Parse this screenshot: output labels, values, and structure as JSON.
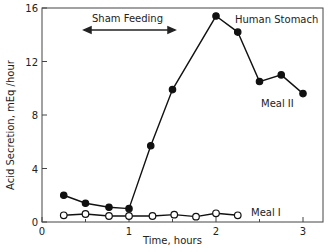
{
  "chart_data": {
    "type": "line",
    "title": "",
    "xlabel": "Time, hours",
    "ylabel": "Acid Secretion, mEq /hour",
    "xlim": [
      0,
      3.2
    ],
    "ylim": [
      0,
      16
    ],
    "x_ticks": [
      "0",
      "1",
      "2",
      "3"
    ],
    "y_ticks": [
      "0",
      "4",
      "8",
      "12",
      "16"
    ],
    "grid": false,
    "annotations": [
      {
        "text": "Sham Feeding",
        "span_x": [
          0.5,
          1.5
        ],
        "type": "double-arrow"
      },
      {
        "text": "Human Stomach"
      }
    ],
    "series": [
      {
        "name": "Meal II",
        "marker": "filled-circle",
        "x": [
          0.25,
          0.5,
          0.77,
          1.0,
          1.25,
          1.5,
          2.0,
          2.25,
          2.5,
          2.75,
          3.0
        ],
        "values": [
          2.0,
          1.4,
          1.1,
          1.0,
          5.7,
          9.9,
          15.4,
          14.2,
          10.5,
          11.0,
          9.6
        ]
      },
      {
        "name": "Meal I",
        "marker": "open-circle",
        "x": [
          0.25,
          0.5,
          0.77,
          1.0,
          1.27,
          1.52,
          1.77,
          2.0,
          2.25
        ],
        "values": [
          0.5,
          0.6,
          0.45,
          0.45,
          0.45,
          0.55,
          0.4,
          0.65,
          0.5
        ]
      }
    ]
  },
  "labels": {
    "sham": "Sham Feeding",
    "stomach": "Human Stomach",
    "meal2": "Meal II",
    "meal1": "Meal I",
    "xlabel": "Time, hours",
    "ylabel": "Acid Secretion, mEq /hour"
  }
}
